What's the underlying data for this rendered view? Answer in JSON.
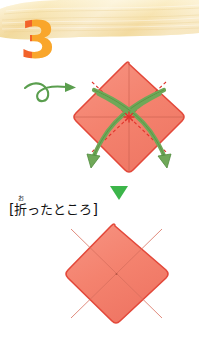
{
  "page": {
    "background_color": "#ffffff",
    "width": 199,
    "height": 338,
    "type": "origami-instruction-step"
  },
  "banner": {
    "name": "decorative-top-banner",
    "fill_color": "#f6dfa2",
    "highlight_color": "#fdf3d6",
    "edge_color": "#efd08a"
  },
  "step": {
    "number": "3",
    "left_color": "#f2622a",
    "right_color": "#f9a62b"
  },
  "turn_arrow": {
    "name": "turn-over-arrow",
    "color": "#5a9e4e",
    "label": "turn over / loop arrow"
  },
  "down_arrow": {
    "name": "next-step-arrow",
    "color": "#3cb54a",
    "label": "proceed downward"
  },
  "figure_top": {
    "name": "folded-paper-diamond-with-fold-arrows",
    "paper_fill": "#f4836f",
    "paper_edge": "#e3483a",
    "crease_color": "#c9604f",
    "valley_dash_color": "#e0332b",
    "fold_arrow_color": "#6fa858",
    "fold_arrow_edge": "#4f8a3c",
    "center_marker_color": "#e0332b",
    "arrows": [
      {
        "from": "top-right-edge",
        "to": "bottom-left-corner"
      },
      {
        "from": "top-left-edge",
        "to": "bottom-right-corner"
      }
    ]
  },
  "figure_bottom": {
    "name": "result-paper-diamond",
    "paper_fill": "#f4836f",
    "paper_edge": "#e3483a",
    "crease_color": "#d9705e"
  },
  "caption": {
    "open_bracket": "[",
    "close_bracket": "]",
    "kanji": "折",
    "furigana": "お",
    "rest": "ったところ",
    "full_text": "[折ったところ]"
  }
}
